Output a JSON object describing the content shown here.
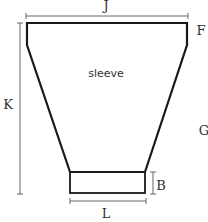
{
  "diagram": {
    "title_label": "sleeve",
    "labels": {
      "J": "J",
      "F": "F",
      "K": "K",
      "G": "G",
      "B": "B",
      "L": "L"
    },
    "colors": {
      "outline": "#1a1a1a",
      "dimension": "#666666",
      "text": "#333333"
    }
  }
}
